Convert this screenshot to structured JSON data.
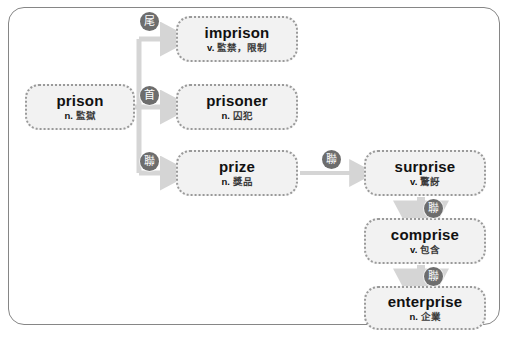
{
  "diagram": {
    "type": "word-family-tree",
    "frame_color": "#868686",
    "node_fill": "#f2f2f2",
    "node_border": "#9a9a9a",
    "arrow_color": "#d5d5d5",
    "badge_color": "#6d6d6d",
    "nodes": [
      {
        "id": "prison",
        "word": "prison",
        "pos": "n.",
        "gloss": "監獄"
      },
      {
        "id": "imprison",
        "word": "imprison",
        "pos": "v.",
        "gloss": "監禁，限制"
      },
      {
        "id": "prisoner",
        "word": "prisoner",
        "pos": "n.",
        "gloss": "囚犯"
      },
      {
        "id": "prize",
        "word": "prize",
        "pos": "n.",
        "gloss": "獎品"
      },
      {
        "id": "surprise",
        "word": "surprise",
        "pos": "v.",
        "gloss": "驚訝"
      },
      {
        "id": "comprise",
        "word": "comprise",
        "pos": "v.",
        "gloss": "包含"
      },
      {
        "id": "enterprise",
        "word": "enterprise",
        "pos": "n.",
        "gloss": "企業"
      }
    ],
    "badges": [
      {
        "id": "imprison",
        "label": "尾"
      },
      {
        "id": "prisoner",
        "label": "首"
      },
      {
        "id": "prize",
        "label": "聯"
      },
      {
        "id": "surprise",
        "label": "聯"
      },
      {
        "id": "comprise",
        "label": "聯"
      },
      {
        "id": "enterprise",
        "label": "聯"
      }
    ],
    "edges": [
      {
        "from": "prison",
        "to": "imprison"
      },
      {
        "from": "prison",
        "to": "prisoner"
      },
      {
        "from": "prison",
        "to": "prize"
      },
      {
        "from": "prize",
        "to": "surprise"
      },
      {
        "from": "surprise",
        "to": "comprise"
      },
      {
        "from": "comprise",
        "to": "enterprise"
      }
    ]
  }
}
